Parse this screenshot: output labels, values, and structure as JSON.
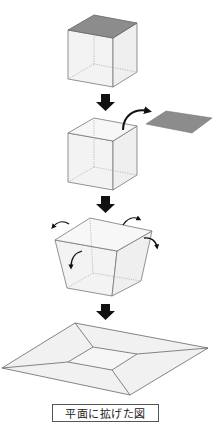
{
  "caption": "平面に拡げた図",
  "colors": {
    "edge": "#6e6e6e",
    "hidden_edge": "#9a9a9a",
    "face_fill": "#f1f1f1",
    "lid_fill": "#8c8c8c",
    "arrow": "#111111"
  },
  "steps": [
    {
      "id": "closed-cube",
      "description": "cube with grey top face"
    },
    {
      "id": "lid-removed",
      "description": "top face lifted off to the right"
    },
    {
      "id": "sides-opening",
      "description": "four side faces folding outward"
    },
    {
      "id": "flattened-net",
      "description": "box flattened into a plane"
    }
  ]
}
